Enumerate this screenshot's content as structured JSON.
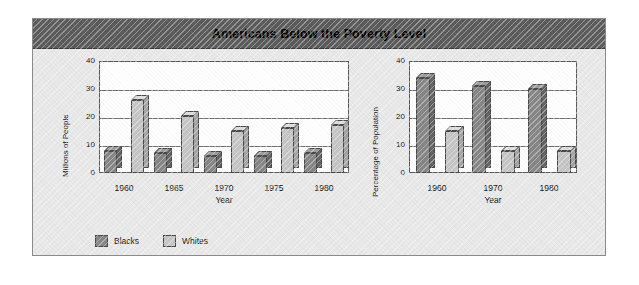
{
  "figure": {
    "title": "Americans Below the Poverty Level",
    "banner_color": "#595959",
    "panel_color": "#e8e8e8",
    "plot_color": "#ffffff"
  },
  "legend": {
    "position": "bottom-left",
    "items": [
      {
        "label": "Blacks",
        "color": "#868686",
        "name": "blacks"
      },
      {
        "label": "Whites",
        "color": "#c5c5c5",
        "name": "whites"
      }
    ]
  },
  "chart_data": [
    {
      "id": "millions",
      "type": "bar",
      "title": "",
      "xlabel": "Year",
      "ylabel": "Millions of People",
      "categories": [
        "1960",
        "1965",
        "1970",
        "1975",
        "1980"
      ],
      "yticks": [
        0,
        10,
        20,
        30,
        40
      ],
      "ylim": [
        0,
        40
      ],
      "grid": true,
      "legend_position": "bottom-left",
      "series": [
        {
          "name": "Blacks",
          "color": "#868686",
          "values": [
            8,
            7,
            6,
            6,
            7
          ]
        },
        {
          "name": "Whites",
          "color": "#c5c5c5",
          "values": [
            26,
            20.5,
            15,
            16,
            17
          ]
        }
      ]
    },
    {
      "id": "percentage",
      "type": "bar",
      "title": "",
      "xlabel": "Year",
      "ylabel": "Percentage of Population",
      "categories": [
        "1960",
        "1970",
        "1980"
      ],
      "yticks": [
        0,
        10,
        20,
        30,
        40
      ],
      "ylim": [
        0,
        40
      ],
      "grid": true,
      "legend_position": "bottom-left",
      "series": [
        {
          "name": "Blacks",
          "color": "#868686",
          "values": [
            34,
            31,
            30
          ]
        },
        {
          "name": "Whites",
          "color": "#c5c5c5",
          "values": [
            15,
            8,
            8
          ]
        }
      ]
    }
  ]
}
